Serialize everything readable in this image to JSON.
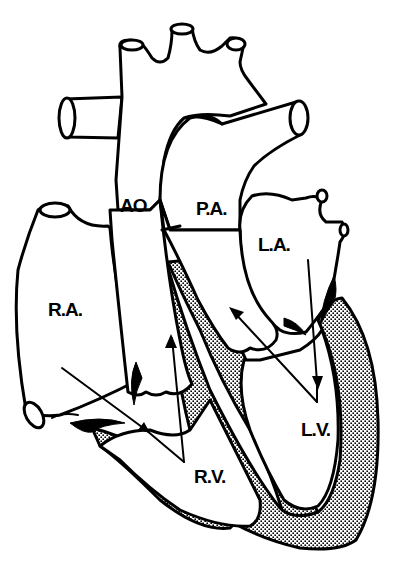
{
  "diagram": {
    "labels": {
      "aorta": "AO",
      "pulmonary_artery": "P.A.",
      "left_atrium": "L.A.",
      "right_atrium": "R.A.",
      "right_ventricle": "R.V.",
      "left_ventricle": "L.V."
    },
    "flow_arrows": [
      {
        "from": "R.A.",
        "to": "R.V."
      },
      {
        "from": "R.V.",
        "to": "AO"
      },
      {
        "from": "L.A.",
        "to": "L.V."
      },
      {
        "from": "L.V.",
        "to": "P.A."
      }
    ],
    "colors": {
      "line": "#000000",
      "background": "#ffffff",
      "wall_stipple": "#000000"
    }
  }
}
